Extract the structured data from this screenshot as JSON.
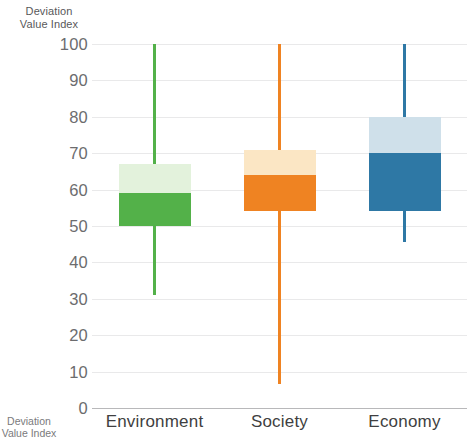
{
  "chart_data": {
    "type": "box",
    "title": "",
    "ylabel": "Deviation Value Index",
    "ylabel_lines": [
      "Deviation",
      "Value Index"
    ],
    "xlabel": "",
    "ylim": [
      0,
      100
    ],
    "ytick_step": 10,
    "yticks": [
      100,
      90,
      80,
      70,
      60,
      50,
      40,
      30,
      20,
      10,
      0
    ],
    "grid": true,
    "legend": "none",
    "categories": [
      "Environment",
      "Society",
      "Economy"
    ],
    "series": [
      {
        "name": "Environment",
        "whisker_high": 100,
        "box_high": 67,
        "median": 59,
        "box_low": 50,
        "whisker_low": 31,
        "color_upper": "#e3f2dc",
        "color_lower": "#53b149",
        "color_whisker": "#53b149"
      },
      {
        "name": "Society",
        "whisker_high": 100,
        "box_high": 71,
        "median": 64,
        "box_low": 54,
        "whisker_low": 6.5,
        "color_upper": "#fbe6c4",
        "color_lower": "#ef8322",
        "color_whisker": "#ef8322"
      },
      {
        "name": "Economy",
        "whisker_high": 100,
        "box_high": 80,
        "median": 70,
        "box_low": 54,
        "whisker_low": 45.5,
        "color_upper": "#cfe0ea",
        "color_lower": "#2e78a5",
        "color_whisker": "#2e78a5"
      }
    ]
  },
  "axis_title": {
    "line1": "Deviation",
    "line2": "Value Index"
  },
  "edge_fragment": {
    "line1": "Deviation",
    "line2": "Value Index"
  },
  "colors": {
    "gridline": "#e9e9ea",
    "baseline": "#b8b8ba",
    "tick_text": "#6c6c6e",
    "category_text": "#3f3f41"
  }
}
